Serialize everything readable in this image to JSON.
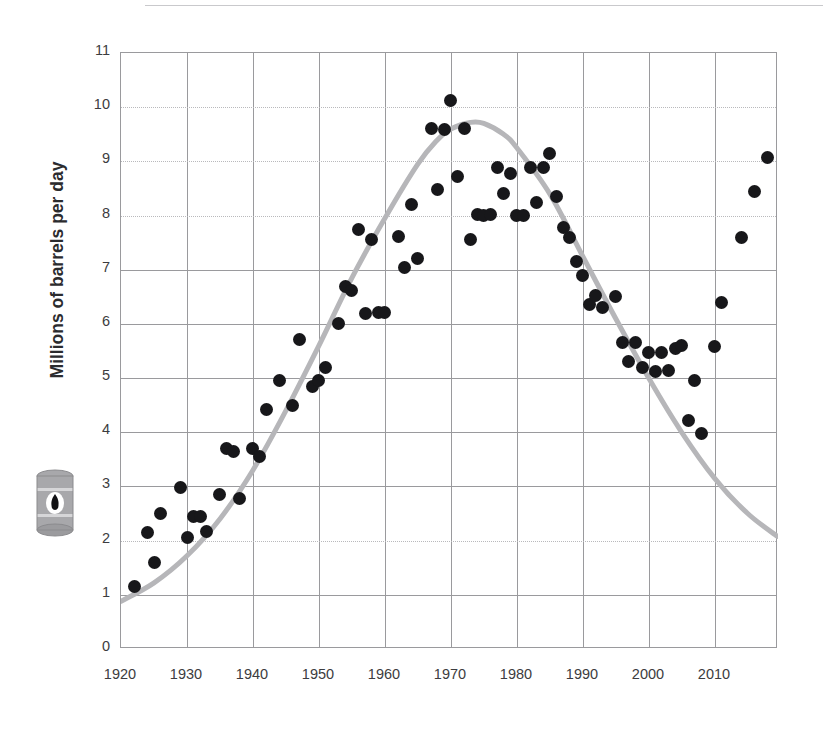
{
  "chart_data": {
    "type": "scatter",
    "title": "",
    "subtitle": "",
    "xlabel": "",
    "ylabel": "Millions of barrels per day",
    "xlim": [
      1920,
      2019.6
    ],
    "ylim": [
      0,
      11
    ],
    "grid": true,
    "legend_position": "none",
    "xticks": [
      1920,
      1930,
      1940,
      1950,
      1960,
      1970,
      1980,
      1990,
      2000,
      2010
    ],
    "yticks": [
      0,
      1,
      2,
      3,
      4,
      5,
      6,
      7,
      8,
      9,
      10,
      11
    ],
    "series": [
      {
        "name": "Annual crude oil production",
        "type": "scatter",
        "marker": "circle",
        "color": "#17171a",
        "points": [
          {
            "x": 1922,
            "y": 1.15
          },
          {
            "x": 1924,
            "y": 2.15
          },
          {
            "x": 1925,
            "y": 1.6
          },
          {
            "x": 1926,
            "y": 2.5
          },
          {
            "x": 1929,
            "y": 2.98
          },
          {
            "x": 1930,
            "y": 2.06
          },
          {
            "x": 1931,
            "y": 2.45
          },
          {
            "x": 1932,
            "y": 2.45
          },
          {
            "x": 1933,
            "y": 2.17
          },
          {
            "x": 1935,
            "y": 2.85
          },
          {
            "x": 1936,
            "y": 3.7
          },
          {
            "x": 1937,
            "y": 3.65
          },
          {
            "x": 1938,
            "y": 2.78
          },
          {
            "x": 1940,
            "y": 3.7
          },
          {
            "x": 1941,
            "y": 3.55
          },
          {
            "x": 1942,
            "y": 4.42
          },
          {
            "x": 1944,
            "y": 4.95
          },
          {
            "x": 1946,
            "y": 4.5
          },
          {
            "x": 1947,
            "y": 5.72
          },
          {
            "x": 1949,
            "y": 4.85
          },
          {
            "x": 1950,
            "y": 4.95
          },
          {
            "x": 1951,
            "y": 5.2
          },
          {
            "x": 1953,
            "y": 6.0
          },
          {
            "x": 1954,
            "y": 6.7
          },
          {
            "x": 1955,
            "y": 6.62
          },
          {
            "x": 1956,
            "y": 7.75
          },
          {
            "x": 1957,
            "y": 6.2
          },
          {
            "x": 1958,
            "y": 7.55
          },
          {
            "x": 1959,
            "y": 6.22
          },
          {
            "x": 1960,
            "y": 6.22
          },
          {
            "x": 1962,
            "y": 7.62
          },
          {
            "x": 1963,
            "y": 7.05
          },
          {
            "x": 1964,
            "y": 8.2
          },
          {
            "x": 1965,
            "y": 7.2
          },
          {
            "x": 1967,
            "y": 9.6
          },
          {
            "x": 1968,
            "y": 8.48
          },
          {
            "x": 1969,
            "y": 9.58
          },
          {
            "x": 1970,
            "y": 10.12
          },
          {
            "x": 1971,
            "y": 8.72
          },
          {
            "x": 1972,
            "y": 9.6
          },
          {
            "x": 1973,
            "y": 7.55
          },
          {
            "x": 1974,
            "y": 8.02
          },
          {
            "x": 1975,
            "y": 8.0
          },
          {
            "x": 1976,
            "y": 8.02
          },
          {
            "x": 1977,
            "y": 8.88
          },
          {
            "x": 1978,
            "y": 8.4
          },
          {
            "x": 1979,
            "y": 8.78
          },
          {
            "x": 1980,
            "y": 8.0
          },
          {
            "x": 1981,
            "y": 8.0
          },
          {
            "x": 1982,
            "y": 8.88
          },
          {
            "x": 1983,
            "y": 8.25
          },
          {
            "x": 1984,
            "y": 8.88
          },
          {
            "x": 1985,
            "y": 9.15
          },
          {
            "x": 1986,
            "y": 8.35
          },
          {
            "x": 1987,
            "y": 7.78
          },
          {
            "x": 1988,
            "y": 7.6
          },
          {
            "x": 1989,
            "y": 7.15
          },
          {
            "x": 1990,
            "y": 6.9
          },
          {
            "x": 1991,
            "y": 6.35
          },
          {
            "x": 1992,
            "y": 6.52
          },
          {
            "x": 1993,
            "y": 6.3
          },
          {
            "x": 1995,
            "y": 6.5
          },
          {
            "x": 1996,
            "y": 5.65
          },
          {
            "x": 1997,
            "y": 5.3
          },
          {
            "x": 1998,
            "y": 5.65
          },
          {
            "x": 1999,
            "y": 5.2
          },
          {
            "x": 2000,
            "y": 5.48
          },
          {
            "x": 2001,
            "y": 5.12
          },
          {
            "x": 2002,
            "y": 5.48
          },
          {
            "x": 2003,
            "y": 5.15
          },
          {
            "x": 2004,
            "y": 5.55
          },
          {
            "x": 2005,
            "y": 5.6
          },
          {
            "x": 2006,
            "y": 4.22
          },
          {
            "x": 2007,
            "y": 4.95
          },
          {
            "x": 2008,
            "y": 3.98
          },
          {
            "x": 2010,
            "y": 5.58
          },
          {
            "x": 2011,
            "y": 6.4
          },
          {
            "x": 2014,
            "y": 7.6
          },
          {
            "x": 2016,
            "y": 8.45
          },
          {
            "x": 2018,
            "y": 9.08
          }
        ]
      },
      {
        "name": "Hubbert curve fit",
        "type": "line",
        "color": "#b6b6b9",
        "linewidth": 5,
        "points": [
          {
            "x": 1920,
            "y": 0.88
          },
          {
            "x": 1925,
            "y": 1.22
          },
          {
            "x": 1930,
            "y": 1.72
          },
          {
            "x": 1935,
            "y": 2.4
          },
          {
            "x": 1940,
            "y": 3.3
          },
          {
            "x": 1945,
            "y": 4.4
          },
          {
            "x": 1950,
            "y": 5.6
          },
          {
            "x": 1955,
            "y": 6.85
          },
          {
            "x": 1960,
            "y": 7.95
          },
          {
            "x": 1965,
            "y": 8.95
          },
          {
            "x": 1968,
            "y": 9.4
          },
          {
            "x": 1970,
            "y": 9.6
          },
          {
            "x": 1973,
            "y": 9.72
          },
          {
            "x": 1975,
            "y": 9.7
          },
          {
            "x": 1978,
            "y": 9.5
          },
          {
            "x": 1980,
            "y": 9.25
          },
          {
            "x": 1985,
            "y": 8.4
          },
          {
            "x": 1990,
            "y": 7.25
          },
          {
            "x": 1995,
            "y": 6.1
          },
          {
            "x": 2000,
            "y": 5.0
          },
          {
            "x": 2005,
            "y": 4.0
          },
          {
            "x": 2010,
            "y": 3.15
          },
          {
            "x": 2015,
            "y": 2.5
          },
          {
            "x": 2019.5,
            "y": 2.08
          }
        ]
      }
    ]
  },
  "axis": {
    "ytick_labels": [
      "11",
      "10",
      "9",
      "8",
      "7",
      "6",
      "5",
      "4",
      "3",
      "2",
      "1",
      "0"
    ],
    "xtick_labels": [
      "1920",
      "1930",
      "1940",
      "1950",
      "1960",
      "1970",
      "1980",
      "1990",
      "2000",
      "2010"
    ],
    "ylabel": "Millions of barrels per day"
  },
  "icons": {
    "barrel": "oil-barrel-icon"
  },
  "colors": {
    "dot": "#17171a",
    "trend": "#b6b6b9",
    "grid": "#9a9a9d",
    "grid_dotted": "#b9b9bc",
    "text": "#3c3c40"
  }
}
